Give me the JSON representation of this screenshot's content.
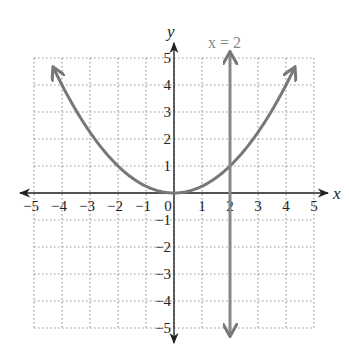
{
  "chart_data": {
    "type": "line",
    "title": "",
    "xlabel": "x",
    "ylabel": "y",
    "xlim": [
      -5,
      5
    ],
    "ylim": [
      -5,
      5
    ],
    "grid": true,
    "grid_style": "dotted",
    "x_ticks": [
      "-5",
      "-4",
      "-3",
      "-2",
      "-1",
      "0",
      "1",
      "2",
      "3",
      "4",
      "5"
    ],
    "y_ticks": [
      "5",
      "4",
      "3",
      "2",
      "1",
      "-1",
      "-2",
      "-3",
      "-4",
      "-5"
    ],
    "series": [
      {
        "name": "parabola",
        "equation": "y = x^2/4",
        "color": "#777777",
        "x": [
          -4.4,
          -4,
          -3,
          -2,
          -1,
          0,
          1,
          2,
          3,
          4,
          4.4
        ],
        "y": [
          4.84,
          4,
          2.25,
          1,
          0.25,
          0,
          0.25,
          1,
          2.25,
          4,
          4.84
        ]
      },
      {
        "name": "x = 2",
        "equation": "x = 2",
        "color": "#888888",
        "x": [
          2,
          2
        ],
        "y": [
          -5,
          5
        ]
      }
    ],
    "annotations": [
      {
        "text": "x = 2",
        "x": 2,
        "y": 5.6
      }
    ]
  }
}
